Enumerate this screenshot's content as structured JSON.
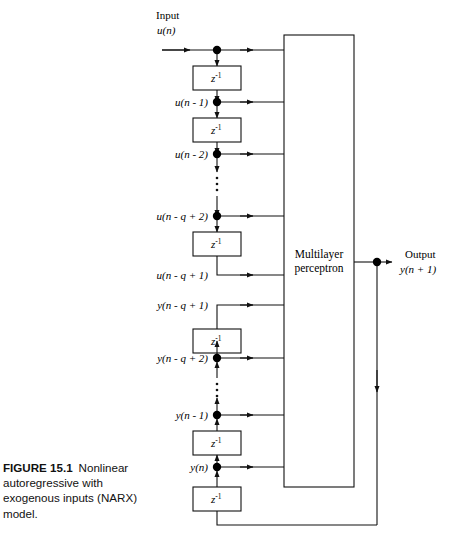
{
  "figure": {
    "number_label": "FIGURE 15.1",
    "caption_text": "Nonlinear autoregressive with exogenous inputs (NARX) model."
  },
  "diagram": {
    "type": "block-diagram",
    "input_label_line1": "Input",
    "input_label_line2": "u(n)",
    "output_label_line1": "Output",
    "output_label_line2": "y(n + 1)",
    "processing_block": {
      "line1": "Multilayer",
      "line2": "perceptron"
    },
    "delay_block_label": "z",
    "delay_block_exponent": "-1",
    "delay_block_count": 7,
    "ellipsis_glyph": "vertical-dots",
    "input_taps": [
      {
        "label": "u(n)",
        "y": 50,
        "node": true,
        "arrow_direction": "down"
      },
      {
        "label": "u(n - 1)",
        "y": 102,
        "node": true,
        "arrow_direction": "down"
      },
      {
        "label": "u(n - 2)",
        "y": 154,
        "node": true,
        "arrow_direction": "down"
      },
      {
        "label": "u(n - q + 2)",
        "y": 216,
        "node": true,
        "arrow_direction": "down"
      },
      {
        "label": "u(n - q + 1)",
        "y": 275,
        "node": false,
        "arrow_direction": "none"
      }
    ],
    "output_taps": [
      {
        "label": "y(n - q + 1)",
        "y": 305,
        "node": false,
        "arrow_direction": "none"
      },
      {
        "label": "y(n - q + 2)",
        "y": 358,
        "node": true,
        "arrow_direction": "up"
      },
      {
        "label": "y(n - 1)",
        "y": 415,
        "node": true,
        "arrow_direction": "up"
      },
      {
        "label": "y(n)",
        "y": 467,
        "node": true,
        "arrow_direction": "up"
      }
    ],
    "feedback_path": "output node down to bottom rail then left into lowest delay block",
    "colors": {
      "line": "#111111",
      "node": "#000000",
      "background": "#ffffff",
      "text": "#000000"
    }
  }
}
